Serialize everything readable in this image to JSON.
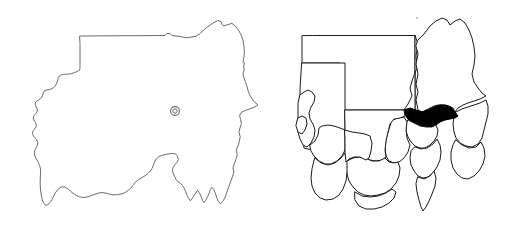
{
  "figure": {
    "title": "",
    "width": 520,
    "height": 232,
    "background_color": "#ffffff",
    "panel_count": 2
  },
  "panels": [
    {
      "id": "country-outline",
      "label": "",
      "description": "Sudan national boundary outline",
      "outline_color": "#5a5a5a",
      "fill_color": "#ffffff",
      "markers": [
        {
          "name": "capital-marker",
          "symbol": "circle-ring",
          "label": "",
          "color": "#6b6b6b",
          "x": 175,
          "y": 111
        }
      ]
    },
    {
      "id": "admin-divisions",
      "label": "",
      "description": "Sudan states (wilayat) boundaries with one state highlighted",
      "outline_color": "#1a1a1a",
      "fill_color": "#ffffff",
      "highlight_color": "#000000",
      "highlighted_region_count": 1,
      "region_count": 18
    }
  ],
  "legend": {
    "visible": false,
    "entries": []
  },
  "annotations": {
    "visible_text": [],
    "axis_labels": [],
    "scale_bar": false,
    "north_arrow": false
  }
}
